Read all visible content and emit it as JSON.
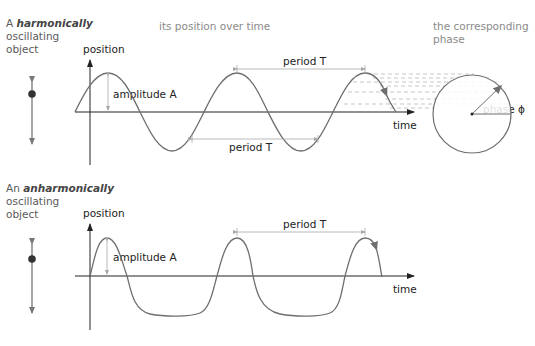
{
  "colors": {
    "curve": "#6e6e6e",
    "axis": "#222222",
    "guide": "#a8a8a8",
    "dashed": "#b8b8b8",
    "oscillator": "#777777"
  },
  "harmonic": {
    "title_prefix": "A ",
    "title_emph": "harmonically",
    "title_line2": "oscillating",
    "title_line3": "object",
    "position_label": "position",
    "amplitude_label": "amplitude A",
    "period_top_label": "period T",
    "period_bottom_label": "period T",
    "time_label": "time"
  },
  "header": {
    "position_over_time": "its position over time",
    "phase_caption_line1": "the corresponding",
    "phase_caption_line2": "phase"
  },
  "phase": {
    "label": "phase ϕ"
  },
  "anharmonic": {
    "title_prefix": "An ",
    "title_emph": "anharmonically",
    "title_line2": "oscillating",
    "title_line3": "object",
    "position_label": "position",
    "amplitude_label": "amplitude A",
    "period_label": "period T",
    "time_label": "time"
  }
}
